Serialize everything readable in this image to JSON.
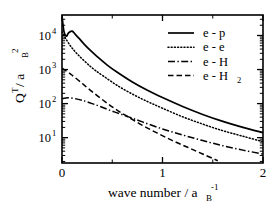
{
  "chart_data": {
    "type": "line",
    "title": "",
    "xlabel": "wave number  /  a_B^-1",
    "xlabel_parts": {
      "text": "wave number  /  a",
      "sub": "B",
      "sup": "-1"
    },
    "ylabel": "Q^T / a_B^2",
    "ylabel_parts": {
      "main": "Q",
      "main_sup": "T",
      "mid": " /  a",
      "sub": "B",
      "sup": "2"
    },
    "xscale": "linear",
    "yscale": "log",
    "xlim": [
      0,
      2
    ],
    "ylim": [
      1.8,
      40000
    ],
    "grid": false,
    "legend_position": "upper-right",
    "xticks": [
      0,
      1,
      2
    ],
    "xtick_labels": [
      "0",
      "1",
      "2"
    ],
    "xticks_minor": [
      0.5,
      1.5
    ],
    "yticks": [
      10,
      100,
      1000,
      10000
    ],
    "ytick_labels": [
      "10^1",
      "10^2",
      "10^3",
      "10^4"
    ],
    "ytick_mantissas": [
      "10",
      "10",
      "10",
      "10"
    ],
    "ytick_exponents": [
      "1",
      "2",
      "3",
      "4"
    ],
    "series": [
      {
        "name": "e - p",
        "label": "e - p",
        "style": "solid",
        "dash": "none",
        "color": "#000000",
        "width": 1.7,
        "x": [
          0.0,
          0.02,
          0.045,
          0.065,
          0.1,
          0.13,
          0.17,
          0.22,
          0.28,
          0.35,
          0.45,
          0.55,
          0.7,
          0.85,
          1.0,
          1.2,
          1.4,
          1.6,
          1.8,
          2.0
        ],
        "y": [
          38000,
          13000,
          9500,
          12000,
          13500,
          11000,
          8200,
          5600,
          3700,
          2400,
          1350,
          830,
          430,
          245,
          150,
          82,
          48,
          30,
          20,
          14
        ]
      },
      {
        "name": "e - e",
        "label": "e - e",
        "style": "dotted",
        "dash": "1,2.2",
        "color": "#000000",
        "width": 1.5,
        "x": [
          0.0,
          0.05,
          0.1,
          0.16,
          0.24,
          0.32,
          0.42,
          0.55,
          0.7,
          0.85,
          1.0,
          1.2,
          1.4,
          1.6,
          1.8,
          2.0
        ],
        "y": [
          13000,
          7000,
          4300,
          2700,
          1600,
          1000,
          620,
          340,
          190,
          115,
          73,
          41,
          25,
          16,
          11,
          7.6
        ]
      },
      {
        "name": "e - H",
        "label": "e - H",
        "style": "dashdot",
        "dash": "7,2.4,1.4,2.4",
        "color": "#000000",
        "width": 1.5,
        "x": [
          0.0,
          0.06,
          0.13,
          0.2,
          0.3,
          0.4,
          0.52,
          0.65,
          0.8,
          1.0,
          1.2,
          1.4,
          1.6,
          1.8,
          2.0
        ],
        "y": [
          140,
          148,
          140,
          125,
          100,
          78,
          57,
          42,
          29,
          18,
          12,
          8.2,
          5.8,
          4.3,
          3.3
        ]
      },
      {
        "name": "e - H2",
        "label": "e - H₂",
        "label_parts": {
          "text": "e - H",
          "sub": "2"
        },
        "style": "dashed",
        "dash": "5.5,3",
        "color": "#000000",
        "width": 1.5,
        "x": [
          0.0,
          0.08,
          0.18,
          0.28,
          0.4,
          0.52,
          0.65,
          0.8,
          0.95,
          1.1,
          1.25,
          1.4,
          1.55
        ],
        "y": [
          1100,
          760,
          440,
          250,
          132,
          73,
          42,
          23,
          13.5,
          8.2,
          5.2,
          3.3,
          2.1
        ]
      }
    ]
  },
  "legend": {
    "entries": [
      {
        "label": "e - p",
        "style": "solid"
      },
      {
        "label": "e - e",
        "style": "dotted"
      },
      {
        "label": "e - H",
        "style": "dashdot"
      },
      {
        "label": "e - H₂",
        "style": "dashed"
      }
    ]
  },
  "colors": {
    "axis": "#000000",
    "background": "#ffffff",
    "curve": "#000000"
  }
}
